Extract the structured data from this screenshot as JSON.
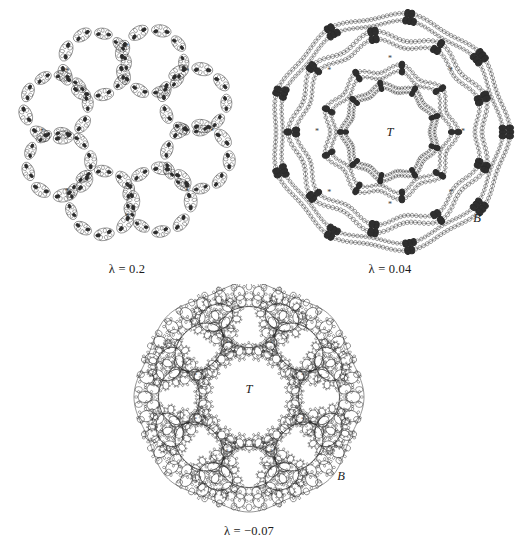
{
  "figure": {
    "name": "limit-set-plate",
    "background": "#ffffff",
    "ink": "#2b2b2b",
    "panels": [
      {
        "id": "a",
        "caption": "λ = 0.2",
        "lambda": 0.2,
        "style": "necklace-of-necklaces",
        "marker": "*",
        "marker_count": 8,
        "symmetry": 8,
        "labels": [],
        "center": [
          125,
          126
        ],
        "radius": 104
      },
      {
        "id": "b",
        "caption": "λ = 0.04",
        "lambda": 0.04,
        "style": "nested-wavy-rings",
        "marker": "*",
        "marker_count": 8,
        "symmetry": 9,
        "labels": [
          {
            "text": "T",
            "name": "label-T",
            "x": 0.5,
            "y": 0.5
          },
          {
            "text": "B",
            "name": "label-B",
            "x": 0.845,
            "y": 0.855
          }
        ],
        "center": [
          126,
          126
        ],
        "radius": 122
      },
      {
        "id": "c",
        "caption": "λ = −0.07",
        "lambda": -0.07,
        "style": "apollonian-annulus",
        "marker": "*",
        "marker_count": 8,
        "symmetry": 8,
        "labels": [
          {
            "text": "T",
            "name": "label-T",
            "x": 0.5,
            "y": 0.47
          },
          {
            "text": "B",
            "name": "label-B",
            "x": 0.895,
            "y": 0.845
          }
        ],
        "center": [
          117,
          113
        ],
        "radius": 112
      }
    ]
  },
  "captions": {
    "a": "λ = 0.2",
    "b": "λ = 0.04",
    "c": "λ = −0.07"
  },
  "labels": {
    "T": "T",
    "B": "B",
    "asterisk": "*"
  }
}
